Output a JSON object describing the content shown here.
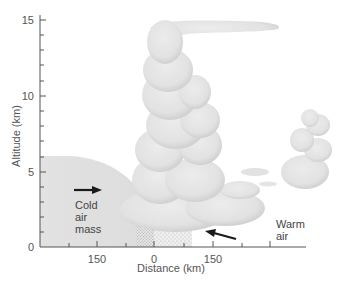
{
  "figure": {
    "type": "cross-section",
    "colors": {
      "cloud": "#e4e4e4",
      "cloud_shade": "#d2d2d2",
      "cold_air": "#e0e0e0",
      "axis": "#555555",
      "arrow": "#1a1a1a",
      "rain": "#b8b8b8"
    }
  },
  "axes": {
    "y": {
      "title": "Altitude (km)",
      "ticks": [
        {
          "value": 0,
          "label": "0"
        },
        {
          "value": 5,
          "label": "5"
        },
        {
          "value": 10,
          "label": "10"
        },
        {
          "value": 15,
          "label": "15"
        }
      ],
      "minor_step": 1,
      "range": [
        0,
        15.5
      ]
    },
    "x": {
      "title": "Distance (km)",
      "ticks": [
        {
          "label": "150"
        },
        {
          "label": "0"
        },
        {
          "label": "150"
        }
      ]
    }
  },
  "annotations": {
    "cold_air": {
      "line1": "Cold",
      "line2": "air",
      "line3": "mass",
      "arrow_direction": "right"
    },
    "warm_air": {
      "line1": "Warm",
      "line2": "air",
      "arrow_direction": "left"
    }
  }
}
